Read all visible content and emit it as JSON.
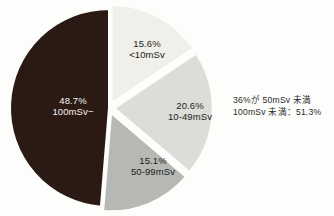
{
  "figure": {
    "title_remnant": "",
    "background_color": "#fdfdfb"
  },
  "annotation": {
    "line1": "36%が 50mSv 未満",
    "line2": "100mSv 未満：51.3%"
  },
  "chart_data": {
    "type": "pie",
    "title": "",
    "xlabel": "",
    "ylabel": "",
    "legend_position": "none",
    "grid": false,
    "exploded": true,
    "start_angle_deg": 0,
    "direction": "clockwise",
    "categories": [
      "100mSv−",
      "<10mSv",
      "10-49mSv",
      "50-99mSv"
    ],
    "values": [
      48.7,
      15.6,
      20.6,
      15.1
    ],
    "unit": "%",
    "colors": [
      "#2b1a13",
      "#f0efe9",
      "#dcdcd8",
      "#b6b8b4"
    ],
    "slices": [
      {
        "name": "100mSv−",
        "percent": 48.7,
        "percent_label": "48.7%",
        "range_label": "100mSv−",
        "color": "#2b1a13",
        "label_color": "#f4f1ee",
        "exploded": false
      },
      {
        "name": "<10mSv",
        "percent": 15.6,
        "percent_label": "15.6%",
        "range_label": "<10mSv",
        "color": "#f0efe9",
        "label_color": "#1c1c1c",
        "exploded": true
      },
      {
        "name": "10-49mSv",
        "percent": 20.6,
        "percent_label": "20.6%",
        "range_label": "10-49mSv",
        "color": "#dcdcd8",
        "label_color": "#1c1c1c",
        "exploded": true
      },
      {
        "name": "50-99mSv",
        "percent": 15.1,
        "percent_label": "15.1%",
        "range_label": "50-99mSv",
        "color": "#b6b8b4",
        "label_color": "#1c1c1c",
        "exploded": true
      }
    ]
  }
}
